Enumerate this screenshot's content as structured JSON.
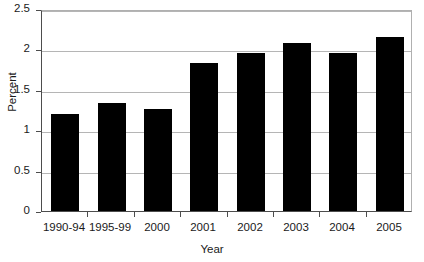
{
  "chart_data": {
    "type": "bar",
    "title": "",
    "xlabel": "Year",
    "ylabel": "Percent",
    "categories": [
      "1990-94",
      "1995-99",
      "2000",
      "2001",
      "2002",
      "2003",
      "2004",
      "2005"
    ],
    "values": [
      1.2,
      1.34,
      1.26,
      1.83,
      1.96,
      2.08,
      1.96,
      2.15
    ],
    "ylim": [
      0,
      2.5
    ],
    "yticks": [
      0,
      0.5,
      1,
      1.5,
      2,
      2.5
    ],
    "ytick_labels": [
      "0",
      "0.5",
      "1",
      "1.5",
      "2",
      "2.5"
    ],
    "grid": true,
    "legend": "none",
    "bar_color": "#000000",
    "axis_color": "#4d4d4d",
    "grid_color": "#b5b5b5",
    "background_color": "#ffffff"
  }
}
